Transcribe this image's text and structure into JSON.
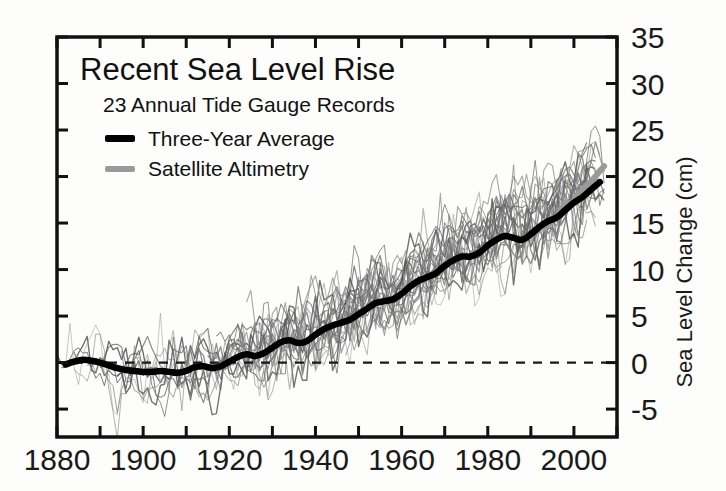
{
  "chart_data": {
    "type": "line",
    "title": "Recent Sea Level Rise",
    "subtitle": "23 Annual Tide Gauge Records",
    "xlabel": "",
    "ylabel": "Sea Level Change (cm)",
    "xlim": [
      1880,
      2010
    ],
    "ylim": [
      -8,
      35
    ],
    "grid": false,
    "legend_position": "top-left",
    "xticks_major": [
      1880,
      1900,
      1920,
      1940,
      1960,
      1980,
      2000
    ],
    "xtick_labels": [
      "1880",
      "1900",
      "1920",
      "1940",
      "1960",
      "1980",
      "2000"
    ],
    "xticks_minor": [
      1890,
      1910,
      1930,
      1950,
      1970,
      1990,
      2010
    ],
    "yticks": [
      -5,
      0,
      5,
      10,
      15,
      20,
      25,
      30,
      35
    ],
    "ytick_labels": [
      "-5",
      "0",
      "5",
      "10",
      "15",
      "20",
      "25",
      "30",
      "35"
    ],
    "zero_line": 0,
    "zero_line_style": "dashed",
    "colors": {
      "three_year_average": "#000000",
      "satellite_altimetry": "#9a9a9a",
      "tide_gauge_records": "#6e6e6e",
      "axis": "#111111",
      "background": "#fdfdfb"
    },
    "legend": [
      {
        "label": "Three-Year Average",
        "color": "#000000",
        "width": 5
      },
      {
        "label": "Satellite Altimetry",
        "color": "#9a9a9a",
        "width": 5
      }
    ],
    "series": [
      {
        "name": "Three-Year Average",
        "color": "#000000",
        "x": [
          1882,
          1884,
          1886,
          1888,
          1890,
          1892,
          1894,
          1896,
          1898,
          1900,
          1902,
          1904,
          1906,
          1908,
          1910,
          1912,
          1914,
          1916,
          1918,
          1920,
          1922,
          1924,
          1926,
          1928,
          1930,
          1932,
          1934,
          1936,
          1938,
          1940,
          1942,
          1944,
          1946,
          1948,
          1950,
          1952,
          1954,
          1956,
          1958,
          1960,
          1962,
          1964,
          1966,
          1968,
          1970,
          1972,
          1974,
          1976,
          1978,
          1980,
          1982,
          1984,
          1986,
          1988,
          1990,
          1992,
          1994,
          1996,
          1998,
          2000,
          2002,
          2004,
          2006
        ],
        "values": [
          -0.2,
          0.1,
          0.3,
          0.2,
          0.0,
          -0.3,
          -0.6,
          -0.8,
          -0.9,
          -1.0,
          -1.0,
          -0.9,
          -1.0,
          -1.1,
          -0.9,
          -0.5,
          -0.4,
          -0.6,
          -0.4,
          0.1,
          0.6,
          0.9,
          0.7,
          1.0,
          1.6,
          2.2,
          2.4,
          2.1,
          2.3,
          3.0,
          3.6,
          4.0,
          4.3,
          4.6,
          5.2,
          5.8,
          6.4,
          6.6,
          6.8,
          7.4,
          8.2,
          8.8,
          9.2,
          9.6,
          10.4,
          11.0,
          11.4,
          11.4,
          11.8,
          12.6,
          13.2,
          13.6,
          13.4,
          13.2,
          13.8,
          14.6,
          15.2,
          15.6,
          16.4,
          17.2,
          17.8,
          18.6,
          19.4
        ]
      },
      {
        "name": "Satellite Altimetry",
        "color": "#9a9a9a",
        "x": [
          1993,
          1994,
          1995,
          1996,
          1997,
          1998,
          1999,
          2000,
          2001,
          2002,
          2003,
          2004,
          2005,
          2006,
          2007
        ],
        "values": [
          14.4,
          14.9,
          15.4,
          15.7,
          16.4,
          17.2,
          17.0,
          17.4,
          18.0,
          18.6,
          19.1,
          19.5,
          20.0,
          20.6,
          21.1
        ]
      }
    ],
    "tide_gauge_record_count": 23,
    "tide_gauge_note": "23 thin grey traces of annual tide gauge records spanning 1880-2007, scattering about the three-year average with roughly +/-8 cm of interannual noise"
  },
  "figure": {
    "axis_frame": {
      "left": 57,
      "right": 617,
      "top": 37,
      "bottom": 437
    }
  }
}
